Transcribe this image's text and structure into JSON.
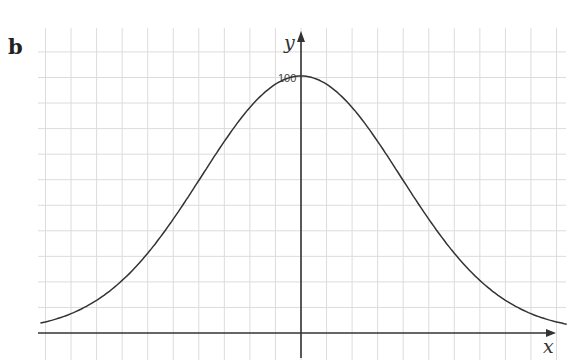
{
  "panel_label": "b",
  "colors": {
    "grid": "#dcdcdc",
    "axis": "#333333",
    "curve": "#333333",
    "background": "#ffffff"
  },
  "chart_data": {
    "type": "line",
    "title": "",
    "panel": "b",
    "xlabel": "x",
    "ylabel": "y",
    "y_tick_labels": [
      "100"
    ],
    "grid": true,
    "grid_spacing_y": 10,
    "ylim": [
      0,
      110
    ],
    "xlim": [
      -10.2,
      10.4
    ],
    "x": [
      -10,
      -8,
      -6,
      -4,
      -2,
      0,
      2,
      4,
      6,
      8,
      10
    ],
    "values": [
      1.2,
      12,
      29,
      60,
      88,
      100,
      88,
      60,
      29,
      12,
      1.2
    ]
  }
}
